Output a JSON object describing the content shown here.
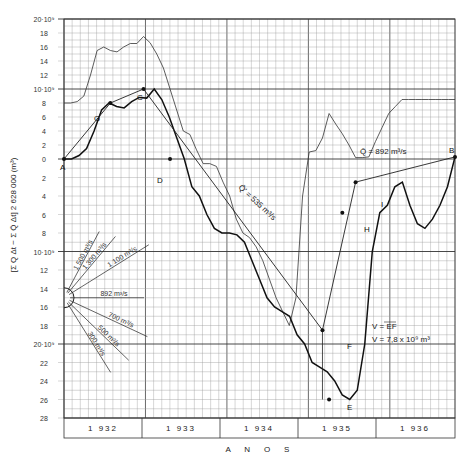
{
  "chart_data": {
    "type": "line",
    "title": "",
    "xlabel": "A N O S",
    "ylabel": "[Σ Q Δt − Σ Q̄ Δt] 2 628 000 (m³)",
    "ylim": [
      -28,
      20
    ],
    "y_unit": "10^9 m³",
    "y_ticks_above": [
      "20·10⁹",
      "18",
      "16",
      "14",
      "12",
      "10·10⁹",
      "8",
      "6",
      "4",
      "2",
      "0"
    ],
    "y_ticks_below": [
      "2",
      "4",
      "6",
      "8",
      "10·10⁹",
      "12",
      "14",
      "16",
      "18",
      "20·10⁹",
      "22",
      "24",
      "26",
      "28"
    ],
    "x_categories": [
      "1 932",
      "1 933",
      "1 934",
      "1 935",
      "1 936"
    ],
    "grid": true,
    "series": [
      {
        "name": "upper envelope (thin)",
        "x": [
          0,
          1,
          2,
          3,
          4,
          5,
          6,
          7,
          8,
          9,
          10,
          11,
          12,
          13,
          14,
          15,
          16,
          17,
          18,
          19,
          20,
          21,
          22,
          23,
          24,
          25,
          26,
          27,
          28,
          29,
          30,
          31,
          32,
          33,
          34,
          35,
          36,
          37,
          38,
          39,
          40,
          41,
          42,
          43,
          44,
          45,
          46,
          47,
          48,
          49,
          50,
          51,
          52,
          53,
          54,
          55,
          56,
          57,
          58,
          59
        ],
        "values": [
          8,
          8,
          8.2,
          9,
          12,
          15.5,
          16,
          15.5,
          15.3,
          16,
          16.5,
          16.5,
          17.5,
          16.6,
          15,
          13,
          10,
          7,
          4,
          3.5,
          1.3,
          -0.5,
          -0.5,
          -0.8,
          -2.5,
          -4,
          -6.5,
          -8,
          -8.5,
          -9.5,
          -11,
          -13,
          -15,
          -16.5,
          -18,
          -15,
          -4,
          1,
          1.2,
          3,
          6.5,
          5,
          3.6,
          2,
          0.2,
          0.2,
          0.3,
          2.5,
          4.5,
          6.5,
          7.5,
          8.5,
          8.5,
          8.5,
          8.5,
          8.5,
          8.5,
          8.5,
          8.5,
          8.5
        ]
      },
      {
        "name": "cumulative deviation (thick)",
        "points": {
          "A": [
            0,
            0
          ],
          "G": [
            7,
            8
          ],
          "C": [
            12,
            10
          ],
          "D": [
            16,
            0
          ],
          "E": [
            40,
            -26
          ],
          "H": [
            42,
            -5.8
          ],
          "I": [
            44,
            -2.5
          ],
          "B": [
            59,
            0.3
          ]
        },
        "values_sample": [
          0,
          0,
          0.5,
          1.5,
          4,
          7,
          8,
          7.5,
          7.3,
          8.2,
          8.8,
          8.7,
          10,
          8.5,
          6,
          3,
          0,
          -3,
          -4,
          -6,
          -7.5,
          -8,
          -8,
          -8.2,
          -9,
          -11,
          -13,
          -15,
          -16,
          -16.5,
          -17,
          -19,
          -20,
          -22,
          -22.5,
          -23,
          -24,
          -25.5,
          -26,
          -25,
          -20,
          -10,
          -5.8,
          -5,
          -3,
          -2.5,
          -5,
          -7,
          -7.5,
          -6.5,
          -5,
          -3,
          0.3
        ]
      },
      {
        "name": "storage line (thin, A-G-C-F, I-B)",
        "points": {
          "A": [
            0,
            0
          ],
          "G": [
            7,
            8
          ],
          "C": [
            12,
            10
          ],
          "F": [
            39,
            -18.5
          ],
          "I": [
            44,
            -2.5
          ],
          "B": [
            59,
            0.3
          ]
        }
      }
    ],
    "annotations": [
      {
        "text": "Q̄ = 892 m³/s",
        "note": "horizontal mean line at 0"
      },
      {
        "text": "Q̄' = 535 m³/s",
        "note": "line C–F"
      },
      {
        "text": "V = EF"
      },
      {
        "text": "V = 7,8 x 10⁹ m³"
      }
    ],
    "rate_fan": [
      "1 500 m³/s",
      "1 300 m³/s",
      "1 100 m³/s",
      "892 m³/s",
      "700 m³/s",
      "500 m³/s",
      "300 m³/s"
    ]
  },
  "labels": {
    "point_A": "A",
    "point_B": "B",
    "point_C": "C",
    "point_D": "D",
    "point_E": "E",
    "point_F": "F",
    "point_G": "G",
    "point_H": "H",
    "point_I": "I",
    "mean_flow": "Q̄ = 892 m³/s",
    "reg_flow": "Q̄' = 535 m³/s",
    "volume_def": "V = EF",
    "volume_val": "V = 7,8 x 10⁹ m³",
    "x_axis": "A    N    O    S",
    "y_axis": "[Σ Q Δt − Σ Q̄ Δt] 2 628 000 (m³)"
  }
}
